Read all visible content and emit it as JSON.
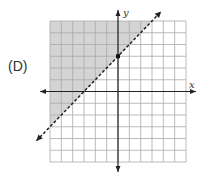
{
  "option_label": "(D)",
  "chart_data": {
    "type": "line",
    "title": "",
    "xlabel": "x",
    "ylabel": "y",
    "xlim": [
      -6,
      6
    ],
    "ylim": [
      -6,
      6
    ],
    "grid": true,
    "series": [
      {
        "name": "boundary",
        "equation": "y = x + 3",
        "style": "dashed",
        "points": [
          [
            -3,
            0
          ],
          [
            0,
            3
          ]
        ]
      }
    ],
    "shaded_region": "y > x + 3",
    "marked_point": [
      0,
      3
    ],
    "colors": {
      "shade": "#d4d4d4",
      "grid": "#aaaaaa",
      "axis": "#222222"
    }
  }
}
